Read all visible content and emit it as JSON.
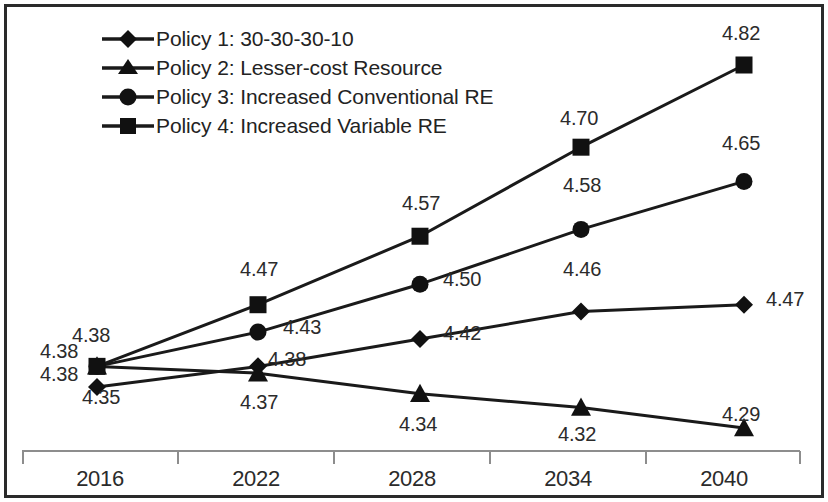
{
  "chart_data": {
    "type": "line",
    "title": "",
    "xlabel": "",
    "ylabel": "",
    "categories": [
      "2016",
      "2022",
      "2028",
      "2034",
      "2040"
    ],
    "ylim": [
      4.25,
      4.86
    ],
    "grid": false,
    "legend_position": "top-left",
    "axis_visible": {
      "x": true,
      "y": false
    },
    "series": [
      {
        "name": "Policy 1: 30-30-30-10",
        "marker": "diamond",
        "values": [
          4.35,
          4.38,
          4.42,
          4.46,
          4.47
        ],
        "labels": [
          "4.35",
          "4.38",
          "4.42",
          "4.46",
          "4.47"
        ]
      },
      {
        "name": "Policy 2: Lesser-cost Resource",
        "marker": "triangle",
        "values": [
          4.38,
          4.37,
          4.34,
          4.32,
          4.29
        ],
        "labels": [
          "4.38",
          "4.37",
          "4.34",
          "4.32",
          "4.29"
        ]
      },
      {
        "name": "Policy 3: Increased Conventional RE",
        "marker": "circle",
        "values": [
          4.38,
          4.43,
          4.5,
          4.58,
          4.65
        ],
        "labels": [
          "4.38",
          "4.43",
          "4.50",
          "4.58",
          "4.65"
        ]
      },
      {
        "name": "Policy 4: Increased Variable RE",
        "marker": "square",
        "values": [
          4.38,
          4.47,
          4.57,
          4.7,
          4.82
        ],
        "labels": [
          "4.38",
          "4.47",
          "4.57",
          "4.70",
          "4.82"
        ]
      }
    ],
    "colors": {
      "line": "#1a1a1a",
      "marker": "#111111",
      "text": "#2b2b2b",
      "axis": "#8a8a8a",
      "border": "#2a2a2a"
    }
  },
  "legend": {
    "items": [
      {
        "label": "Policy 1: 30-30-30-10",
        "marker": "diamond"
      },
      {
        "label": "Policy 2: Lesser-cost Resource",
        "marker": "triangle"
      },
      {
        "label": "Policy 3: Increased Conventional RE",
        "marker": "circle"
      },
      {
        "label": "Policy 4: Increased Variable RE",
        "marker": "square"
      }
    ]
  },
  "axis": {
    "x_tick_labels": [
      "2016",
      "2022",
      "2028",
      "2034",
      "2040"
    ]
  },
  "data_labels": {
    "y2016": {
      "policy4_top": "4.38",
      "policy3_left": "4.38",
      "policy2_left": "4.38",
      "policy1_bottom": "4.35"
    },
    "y2022": {
      "policy4": "4.47",
      "policy3": "4.43",
      "policy1": "4.38",
      "policy2": "4.37"
    },
    "y2028": {
      "policy4": "4.57",
      "policy3": "4.50",
      "policy1": "4.42",
      "policy2": "4.34"
    },
    "y2034": {
      "policy4": "4.70",
      "policy3": "4.58",
      "policy1": "4.46",
      "policy2": "4.32"
    },
    "y2040": {
      "policy4": "4.82",
      "policy3": "4.65",
      "policy1": "4.47",
      "policy2": "4.29"
    }
  }
}
